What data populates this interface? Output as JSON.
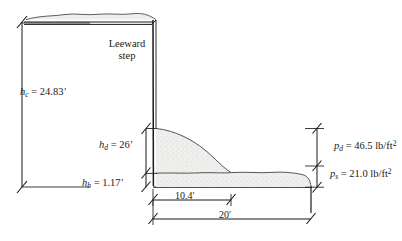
{
  "diagram": {
    "labels": {
      "leeward_step_line1": "Leeward",
      "leeward_step_line2": "step",
      "hc_symbol": "h",
      "hc_subscript": "c",
      "hc_value": "= 24.83",
      "hc_unit": "′",
      "hd_symbol": "h",
      "hd_subscript": "d",
      "hd_value": "= 26",
      "hd_unit": "′",
      "hb_symbol": "h",
      "hb_subscript": "b",
      "hb_value": "= 1.17",
      "hb_unit": "′",
      "dim_drift_width": "10.4′",
      "dim_total_width": "20′",
      "pd_symbol": "p",
      "pd_subscript": "d",
      "pd_value": "= 46.5 lb/ft",
      "pd_exponent": "2",
      "ps_symbol": "p",
      "ps_subscript": "s",
      "ps_value": "= 21.0 lb/ft",
      "ps_exponent": "2"
    },
    "colors": {
      "line": "#1a1a1a",
      "snow_fill": "#eeeeec",
      "snow_edge": "#4d4d4d",
      "background": "#ffffff"
    },
    "dimensions": {
      "wall_clear_height": "24.83",
      "drift_height": "26",
      "balanced_snow_depth": "1.17",
      "drift_width": "10.4",
      "lower_roof_width": "20",
      "drift_pressure": "46.5",
      "balanced_pressure": "21.0",
      "length_unit": "ft",
      "pressure_unit": "lb/ft2"
    }
  }
}
